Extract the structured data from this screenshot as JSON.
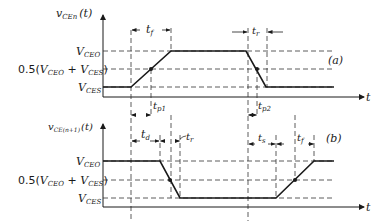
{
  "diagram": {
    "type": "switching waveform timing diagram",
    "panel_a": {
      "tag": "(a)",
      "y_axis_label": "v",
      "y_axis_sub": "CEn",
      "y_axis_arg": "(t)",
      "x_axis_label": "t",
      "levels": {
        "high": {
          "pre": "V",
          "sub": "CEO"
        },
        "mid": {
          "coef": "0.5(",
          "a": "V",
          "asub": "CEO",
          "plus": " + ",
          "b": "V",
          "bsub": "CES",
          "close": ")"
        },
        "low": {
          "pre": "V",
          "sub": "CES"
        }
      },
      "intervals": [
        {
          "pre": "t",
          "sub": "f"
        },
        {
          "pre": "t",
          "sub": "r"
        },
        {
          "pre": "t",
          "sub": "p1"
        },
        {
          "pre": "t",
          "sub": "p2"
        }
      ]
    },
    "panel_b": {
      "tag": "(b)",
      "y_axis_label": "v",
      "y_axis_sub": "CE(n+1)",
      "y_axis_arg": "(t)",
      "x_axis_label": "t",
      "levels": {
        "high": {
          "pre": "V",
          "sub": "CEO"
        },
        "mid": {
          "coef": "0.5(",
          "a": "V",
          "asub": "CEO",
          "plus": " + ",
          "b": "V",
          "bsub": "CES",
          "close": ")"
        },
        "low": {
          "pre": "V",
          "sub": "CES"
        }
      },
      "intervals": [
        {
          "pre": "t",
          "sub": "d"
        },
        {
          "pre": "t",
          "sub": "r"
        },
        {
          "pre": "t",
          "sub": "s"
        },
        {
          "pre": "t",
          "sub": "f"
        }
      ]
    }
  }
}
